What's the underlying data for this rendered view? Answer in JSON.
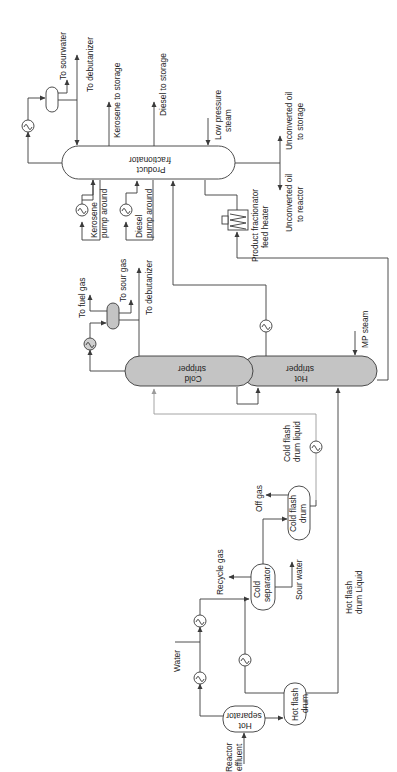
{
  "diagram": {
    "type": "process-flow-diagram",
    "orientation": "rotated-90-ccw",
    "colors": {
      "line": "#3a3a3a",
      "stripper_fill": "#c4c4c4",
      "background": "#ffffff"
    },
    "equipment": {
      "product_fractionator": [
        "Product",
        "fractionator"
      ],
      "cold_stripper": [
        "Cold",
        "stripper"
      ],
      "hot_stripper": [
        "Hot",
        "stripper"
      ],
      "hot_separator": [
        "Hot",
        "separator"
      ],
      "hot_flash_drum": [
        "Hot flash",
        "drum"
      ],
      "cold_separator": [
        "Cold",
        "separator"
      ],
      "cold_flash_drum": [
        "Cold flash",
        "drum"
      ],
      "feed_heater": [
        "Product fractionator",
        "feed heater"
      ]
    },
    "streams": {
      "to_sourwater": "To sourwater",
      "to_debutanizer_top": "To debutanizer",
      "kerosene_to_storage": "Kerosene to storage",
      "diesel_to_storage": "Diesel to storage",
      "low_pressure_steam": [
        "Low pressure",
        "steam"
      ],
      "unconverted_oil_storage": [
        "Unconverted oil",
        "to storage"
      ],
      "unconverted_oil_reactor": [
        "Unconverted oil",
        "to reactor"
      ],
      "kerosene_pump_around": [
        "Kerosene",
        "pump around"
      ],
      "diesel_pump_around": [
        "Diesel",
        "pump around"
      ],
      "to_fuel_gas": "To fuel gas",
      "to_sour_gas": "To sour gas",
      "to_debutanizer_mid": "To debutanizer",
      "mp_steam": "MP steam",
      "cold_flash_drum_liquid": [
        "Cold flash",
        "drum liquid"
      ],
      "off_gas": "Off gas",
      "recycle_gas": "Recycle gas",
      "sour_water": "Sour water",
      "water": "Water",
      "hot_flash_drum_liquid": [
        "Hot flash",
        "drum Liquid"
      ],
      "reactor_effluent": [
        "Reactor",
        "effluent"
      ]
    }
  }
}
